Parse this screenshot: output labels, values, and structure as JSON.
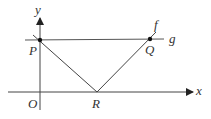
{
  "diagram": {
    "axes": {
      "x_label": "x",
      "y_label": "y",
      "origin_label": "O"
    },
    "points": {
      "P": "P",
      "Q": "Q",
      "R": "R"
    },
    "lines": {
      "f": "f",
      "g": "g"
    },
    "colors": {
      "stroke": "#333333",
      "background": "#ffffff"
    }
  }
}
